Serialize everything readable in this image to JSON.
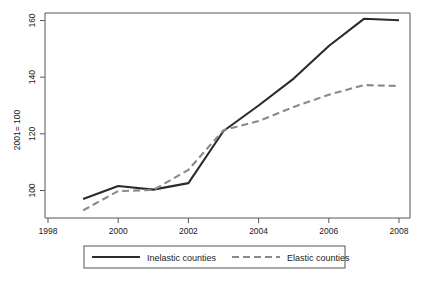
{
  "chart_data": {
    "type": "line",
    "title": "",
    "subtitle": "",
    "xlabel": "",
    "ylabel": "2001= 100",
    "x": [
      1999,
      2000,
      2001,
      2002,
      2003,
      2004,
      2005,
      2006,
      2007,
      2008
    ],
    "xlim": [
      1998,
      2008
    ],
    "ylim": [
      92,
      163
    ],
    "xticks": [
      1998,
      2000,
      2002,
      2004,
      2006,
      2008
    ],
    "xticklabels": [
      "1998",
      "2000",
      "2002",
      "2004",
      "2006",
      "2008"
    ],
    "yticks": [
      100,
      120,
      140,
      160
    ],
    "yticklabels": [
      "100",
      "120",
      "140",
      "160"
    ],
    "grid": false,
    "legend_position": "below-axes",
    "series": [
      {
        "name": "Inelastic counties",
        "style": "solid",
        "color": "#2b2b2b",
        "values": [
          97.0,
          101.6,
          100.3,
          102.6,
          121.0,
          130.0,
          139.5,
          151.0,
          160.6,
          160.1
        ]
      },
      {
        "name": "Elastic counties",
        "style": "dashed",
        "color": "#8a8a8a",
        "values": [
          93.0,
          99.8,
          100.2,
          107.3,
          121.3,
          124.5,
          129.5,
          133.8,
          137.2,
          136.9
        ]
      }
    ]
  },
  "legend": {
    "items": [
      {
        "label": "Inelastic counties",
        "style": "solid",
        "color": "#2b2b2b"
      },
      {
        "label": "Elastic counties",
        "style": "dashed",
        "color": "#8a8a8a"
      }
    ]
  },
  "axes": {
    "y_axis_title": "2001= 100"
  }
}
